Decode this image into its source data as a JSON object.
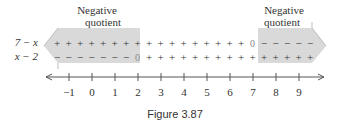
{
  "figure": {
    "caption": "Figure 3.87",
    "labels": {
      "left_region": [
        "Negative",
        "quotient"
      ],
      "right_region": [
        "Negative",
        "quotient"
      ]
    },
    "rows": [
      {
        "expression": "7 − x",
        "signs": [
          "+",
          "+",
          "+",
          "+",
          "+",
          "+",
          "+",
          "+",
          "+",
          "+",
          "+",
          "+",
          "+",
          "+",
          "+",
          "+",
          "+",
          "0",
          "−",
          "−",
          "−",
          "−",
          "−"
        ]
      },
      {
        "expression": "x − 2",
        "signs": [
          "−",
          "−",
          "−",
          "−",
          "−",
          "−",
          "−",
          "0",
          "+",
          "+",
          "+",
          "+",
          "+",
          "+",
          "+",
          "+",
          "+",
          "+",
          "+",
          "+",
          "+",
          "+",
          "+"
        ]
      }
    ],
    "number_line": {
      "ticks": [
        "−1",
        "0",
        "1",
        "2",
        "3",
        "4",
        "5",
        "6",
        "7",
        "8",
        "9"
      ]
    },
    "colors": {
      "shade": "#d9d9d9",
      "shade_edge": "#bdbdbd",
      "text": "#333333",
      "axis": "#555555"
    }
  }
}
